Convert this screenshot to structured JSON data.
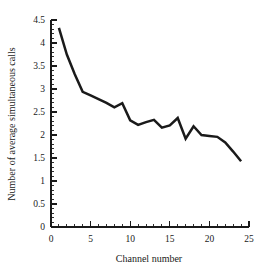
{
  "chart_data": {
    "type": "line",
    "title": "",
    "xlabel": "Channel number",
    "ylabel": "Number of average simultaneous calls",
    "xlim": [
      0,
      25
    ],
    "ylim": [
      0,
      4.5
    ],
    "grid": false,
    "legend": null,
    "x_ticks": [
      "0",
      "5",
      "10",
      "15",
      "20",
      "25"
    ],
    "x_tick_values": [
      0,
      5,
      10,
      15,
      20,
      25
    ],
    "x_minor_tick_step": 1,
    "y_ticks": [
      "0",
      "0.5",
      "1",
      "1.5",
      "2",
      "2.5",
      "3",
      "3.5",
      "4",
      "4.5"
    ],
    "y_tick_values": [
      0,
      0.5,
      1,
      1.5,
      2,
      2.5,
      3,
      3.5,
      4,
      4.5
    ],
    "y_minor_tick_step": 0.1,
    "line_color": "#1a1a1a",
    "series": [
      {
        "name": "average simultaneous calls",
        "x": [
          1,
          2,
          3,
          4,
          5,
          6,
          7,
          8,
          9,
          10,
          11,
          12,
          13,
          14,
          15,
          16,
          17,
          18,
          19,
          20,
          21,
          22,
          23,
          24
        ],
        "values": [
          4.33,
          3.75,
          3.32,
          2.94,
          2.86,
          2.78,
          2.7,
          2.6,
          2.69,
          2.32,
          2.22,
          2.28,
          2.33,
          2.16,
          2.21,
          2.37,
          1.92,
          2.19,
          2.0,
          1.98,
          1.96,
          1.84,
          1.64,
          1.43
        ]
      }
    ]
  }
}
